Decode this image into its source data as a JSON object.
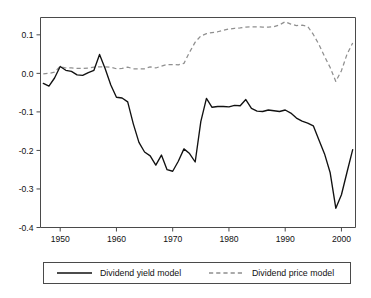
{
  "chart_data": {
    "type": "line",
    "title": "",
    "subtitle": "",
    "xlabel": "",
    "ylabel": "",
    "xlim": [
      1946.5,
      2002.5
    ],
    "ylim": [
      -0.4,
      0.145
    ],
    "grid": false,
    "legend_position": "below",
    "xticks": [
      1950,
      1960,
      1970,
      1980,
      1990,
      2000
    ],
    "xticklabels": [
      "1950",
      "1960",
      "1970",
      "1980",
      "1990",
      "2000"
    ],
    "yticks": [
      0.1,
      0.0,
      -0.1,
      -0.2,
      -0.3,
      -0.4
    ],
    "yticklabels": [
      "0.1",
      "0.0",
      "-0.1",
      "-0.2",
      "-0.3",
      "-0.4"
    ],
    "x": [
      1947,
      1948,
      1949,
      1950,
      1951,
      1952,
      1953,
      1954,
      1955,
      1956,
      1957,
      1958,
      1959,
      1960,
      1961,
      1962,
      1963,
      1964,
      1965,
      1966,
      1967,
      1968,
      1969,
      1970,
      1971,
      1972,
      1973,
      1974,
      1975,
      1976,
      1977,
      1978,
      1979,
      1980,
      1981,
      1982,
      1983,
      1984,
      1985,
      1986,
      1987,
      1988,
      1989,
      1990,
      1991,
      1992,
      1993,
      1994,
      1995,
      1996,
      1997,
      1998,
      1999,
      2000,
      2001,
      2002
    ],
    "series": [
      {
        "name": "Dividend yield model",
        "style": "solid",
        "color": "#111111",
        "values": [
          -0.026,
          -0.033,
          -0.012,
          0.018,
          0.008,
          0.005,
          -0.004,
          -0.005,
          0.002,
          0.008,
          0.049,
          0.012,
          -0.03,
          -0.062,
          -0.064,
          -0.074,
          -0.131,
          -0.179,
          -0.204,
          -0.214,
          -0.238,
          -0.212,
          -0.25,
          -0.254,
          -0.228,
          -0.196,
          -0.208,
          -0.23,
          -0.125,
          -0.065,
          -0.088,
          -0.086,
          -0.086,
          -0.087,
          -0.083,
          -0.084,
          -0.068,
          -0.091,
          -0.098,
          -0.099,
          -0.095,
          -0.097,
          -0.099,
          -0.095,
          -0.103,
          -0.116,
          -0.124,
          -0.129,
          -0.136,
          -0.173,
          -0.209,
          -0.258,
          -0.35,
          -0.315,
          -0.256,
          -0.198
        ]
      },
      {
        "name": "Dividend price model",
        "style": "dashed",
        "color": "#8f8f8f",
        "values": [
          -0.001,
          0.0,
          0.003,
          0.018,
          0.014,
          0.014,
          0.013,
          0.013,
          0.014,
          0.016,
          0.017,
          0.017,
          0.016,
          0.012,
          0.013,
          0.016,
          0.012,
          0.012,
          0.012,
          0.017,
          0.014,
          0.019,
          0.023,
          0.023,
          0.022,
          0.026,
          0.055,
          0.081,
          0.097,
          0.103,
          0.106,
          0.108,
          0.112,
          0.115,
          0.117,
          0.118,
          0.12,
          0.121,
          0.121,
          0.12,
          0.12,
          0.121,
          0.126,
          0.134,
          0.128,
          0.124,
          0.125,
          0.122,
          0.101,
          0.075,
          0.044,
          0.015,
          -0.021,
          0.007,
          0.05,
          0.079
        ]
      }
    ]
  }
}
